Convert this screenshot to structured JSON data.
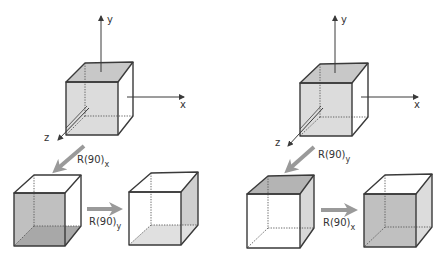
{
  "figure": {
    "colors": {
      "edge": "#3a3a3a",
      "shade_dark": "#b4b4b4",
      "shade_mid": "#c8c8c8",
      "shade_light": "#dcdcdc",
      "face_white": "#ffffff",
      "arrow": "#9a9a9a"
    },
    "left_sequence": {
      "axes": {
        "x_label": "x",
        "y_label": "y",
        "z_label": "z"
      },
      "step1": {
        "op": "R(90)",
        "sub": "x"
      },
      "step2": {
        "op": "R(90)",
        "sub": "y"
      }
    },
    "right_sequence": {
      "axes": {
        "x_label": "x",
        "y_label": "y",
        "z_label": "z"
      },
      "step1": {
        "op": "R(90)",
        "sub": "y"
      },
      "step2": {
        "op": "R(90)",
        "sub": "x"
      }
    }
  }
}
